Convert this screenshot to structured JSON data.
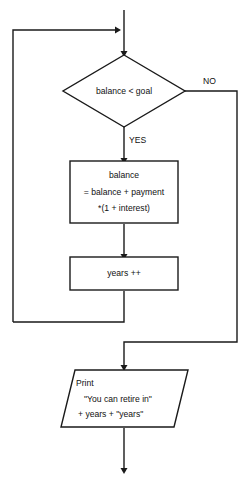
{
  "diagram": {
    "stroke_color": "#1a1a1a",
    "text_color": "#111111",
    "background_color": "#ffffff"
  },
  "nodes": {
    "decision": {
      "shape": "diamond",
      "text": "balance < goal"
    },
    "process_balance": {
      "shape": "rectangle",
      "line1": "balance",
      "line2": "= balance + payment",
      "line3": "*(1 + interest)"
    },
    "process_years": {
      "shape": "rectangle",
      "text": "years ++"
    },
    "output_print": {
      "shape": "parallelogram",
      "line1": "Print",
      "line2": "\"You can retire in\"",
      "line3": "+ years + \"years\""
    }
  },
  "edges": {
    "yes_label": "YES",
    "no_label": "NO"
  }
}
